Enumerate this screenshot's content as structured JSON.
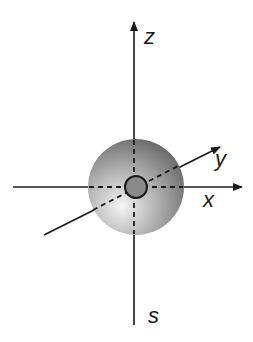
{
  "diagram": {
    "type": "3d-coordinate-axes-with-sphere",
    "axes": [
      {
        "name": "z",
        "label": "z",
        "direction": "up"
      },
      {
        "name": "x",
        "label": "x",
        "direction": "right"
      },
      {
        "name": "y",
        "label": "y",
        "direction": "diagonal-up-right"
      }
    ],
    "bottom_label": "s",
    "objects": [
      {
        "name": "outer-sphere",
        "style": "radial-gradient-gray"
      },
      {
        "name": "inner-circle",
        "style": "gray-with-dark-outline"
      }
    ],
    "colors": {
      "line": "#1a1a1a",
      "sphere_light": "#f2f2f2",
      "sphere_dark": "#6e6e6e",
      "inner_fill": "#8a8a8a"
    }
  }
}
